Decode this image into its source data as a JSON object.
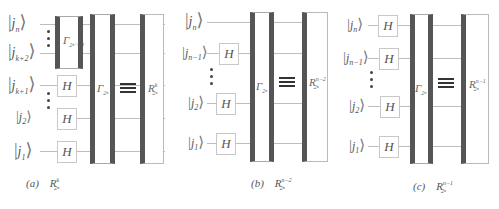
{
  "panels": [
    {
      "id": "a",
      "caption_tag": "(a)",
      "caption_R": "R",
      "caption_sup": "k",
      "caption_sub": "2ⁿ",
      "kets": [
        {
          "var": "j",
          "sub": "n"
        },
        {
          "var": "j",
          "sub": "k+2"
        },
        {
          "var": "j",
          "sub": "k+1"
        },
        {
          "var": "j",
          "sub": "2"
        },
        {
          "var": "j",
          "sub": "1"
        }
      ],
      "sub_gate": {
        "symbol": "Γ",
        "sub": "2ⁿ⁻ᵏ⁻¹"
      },
      "h_gates": [
        "H",
        "H",
        "H"
      ],
      "main_gate": {
        "symbol": "Γ",
        "sub": "2ⁿ"
      },
      "equiv": "≡",
      "result_gate": {
        "symbol": "R",
        "sup": "k",
        "sub": "2ⁿ"
      }
    },
    {
      "id": "b",
      "caption_tag": "(b)",
      "caption_R": "R",
      "caption_sup": "n−2",
      "caption_sub": "2ⁿ",
      "kets": [
        {
          "var": "j",
          "sub": "n"
        },
        {
          "var": "j",
          "sub": "n−1"
        },
        {
          "var": "j",
          "sub": "2"
        },
        {
          "var": "j",
          "sub": "1"
        }
      ],
      "h_gates": [
        "H",
        "H",
        "H"
      ],
      "main_gate": {
        "symbol": "Γ",
        "sub": "2ⁿ"
      },
      "equiv": "≡",
      "result_gate": {
        "symbol": "R",
        "sup": "n−2",
        "sub": "2ⁿ"
      }
    },
    {
      "id": "c",
      "caption_tag": "(c)",
      "caption_R": "R",
      "caption_sup": "n−1",
      "caption_sub": "2ⁿ",
      "kets": [
        {
          "var": "j",
          "sub": "n"
        },
        {
          "var": "j",
          "sub": "n−1"
        },
        {
          "var": "j",
          "sub": "2"
        },
        {
          "var": "j",
          "sub": "1"
        }
      ],
      "h_gates": [
        "H",
        "H",
        "H",
        "H"
      ],
      "main_gate": {
        "symbol": "Γ",
        "sub": "2ⁿ"
      },
      "equiv": "≡",
      "result_gate": {
        "symbol": "R",
        "sup": "n−1",
        "sub": "2ⁿ"
      }
    }
  ],
  "colors": {
    "gate_bar": "#555555",
    "wire": "#bdbdbd",
    "box_border": "#c8c8c8",
    "text": "#555555"
  }
}
